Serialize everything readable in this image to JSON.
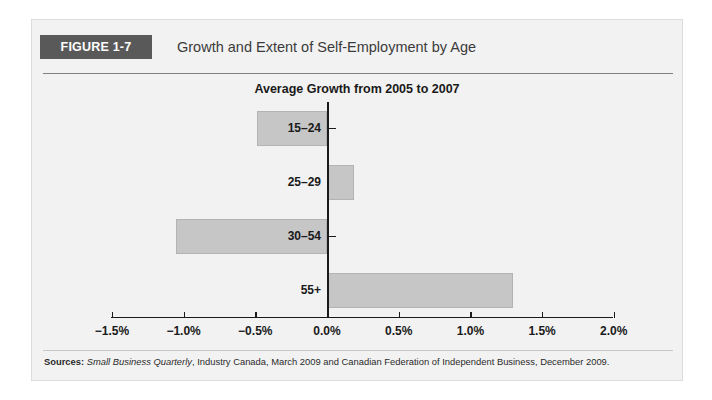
{
  "figure": {
    "badge_label": "FIGURE 1-7",
    "title": "Growth and Extent of Self-Employment by Age",
    "badge_color": "#595959",
    "panel_color": "#f2f2f2"
  },
  "source": {
    "label": "Sources:",
    "italic_part": "Small Business Quarterly",
    "rest": ", Industry Canada, March 2009 and Canadian Federation of Independent Business, December 2009."
  },
  "chart_data": {
    "type": "bar",
    "orientation": "horizontal",
    "title": "Average Growth from 2005 to 2007",
    "xlabel": "",
    "ylabel": "",
    "categories": [
      "15–24",
      "25–29",
      "30–54",
      "55+"
    ],
    "values": [
      -0.49,
      0.19,
      -1.05,
      1.3
    ],
    "value_unit": "%",
    "xlim": [
      -1.5,
      2.0
    ],
    "xticks": [
      -1.5,
      -1.0,
      -0.5,
      0.0,
      0.5,
      1.0,
      1.5,
      2.0
    ],
    "xtick_labels": [
      "−1.5%",
      "−1.0%",
      "−0.5%",
      "0.0%",
      "0.5%",
      "1.0%",
      "1.5%",
      "2.0%"
    ],
    "grid": false,
    "legend": null,
    "bar_color": "#c6c6c6",
    "bar_border_color": "#b3b3b3",
    "axis_color": "#1a1a1a"
  }
}
